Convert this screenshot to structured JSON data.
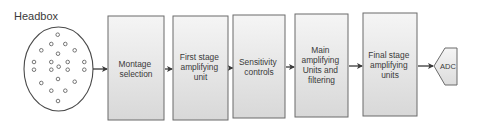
{
  "diagram": {
    "headbox": {
      "label": "Headbox",
      "electrode_count": 21
    },
    "blocks": [
      {
        "id": "montage",
        "lines": [
          "Montage",
          "selection"
        ]
      },
      {
        "id": "first-stage",
        "lines": [
          "First stage",
          "amplifying",
          "unit"
        ]
      },
      {
        "id": "sensitivity",
        "lines": [
          "Sensitivity",
          "controls"
        ]
      },
      {
        "id": "main-amp",
        "lines": [
          "Main",
          "amplifying",
          "Units and",
          "filtering"
        ]
      },
      {
        "id": "final-stage",
        "lines": [
          "Final stage",
          "amplifying",
          "units"
        ]
      }
    ],
    "output": {
      "label": "ADC"
    },
    "flow": [
      "Headbox",
      "Montage selection",
      "First stage amplifying unit",
      "Sensitivity controls",
      "Main amplifying Units and filtering",
      "Final stage amplifying units",
      "ADC"
    ],
    "colors": {
      "box_fill_top": "#f4f4f4",
      "box_fill_bottom": "#d9d9d9",
      "stroke": "#6b6b6b",
      "arrow": "#3a3a3a",
      "text": "#3a3a3a"
    }
  }
}
